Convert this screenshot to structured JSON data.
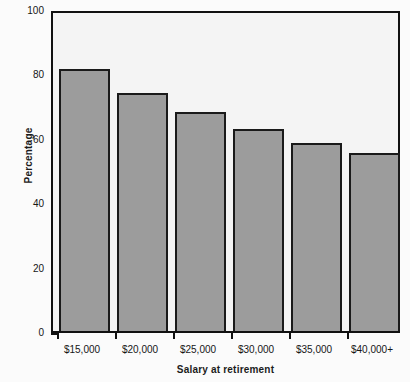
{
  "chart_data": {
    "type": "bar",
    "title": "",
    "xlabel": "Salary at retirement",
    "ylabel": "Percentage",
    "categories": [
      "$15,000",
      "$20,000",
      "$25,000",
      "$30,000",
      "$35,000",
      "$40,000+"
    ],
    "values": [
      82.5,
      75.0,
      69.0,
      63.5,
      59.0,
      56.0
    ],
    "ylim": [
      0,
      100
    ],
    "ytick_labels": [
      "0",
      "20",
      "40",
      "60",
      "80",
      "100"
    ],
    "ytick_values": [
      0,
      20,
      40,
      60,
      80,
      100
    ],
    "yminor_ticks": [
      10,
      30,
      50,
      70,
      90
    ],
    "grid": false,
    "legend": false,
    "bar_color": "#9c9c9c",
    "bar_edge_color": "#1a1a1a",
    "plot_background": "#f4f4f4",
    "axis_color": "#111111"
  }
}
